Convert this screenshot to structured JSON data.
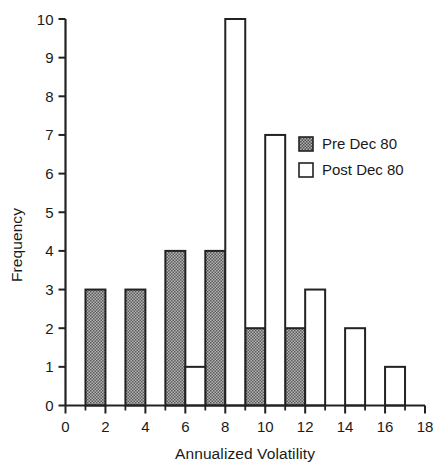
{
  "chart_data": {
    "type": "bar",
    "title": "",
    "subtitle": "",
    "xlabel": "Annualized Volatility",
    "ylabel": "Frequency",
    "xlim": [
      0,
      18
    ],
    "ylim": [
      0,
      10
    ],
    "x_major_ticks": [
      0,
      2,
      4,
      6,
      8,
      10,
      12,
      14,
      16,
      18
    ],
    "x_major_tick_labels": [
      "0",
      "2",
      "4",
      "6",
      "8",
      "10",
      "12",
      "14",
      "16",
      "18"
    ],
    "x_minor_ticks": [
      1,
      3,
      5,
      7,
      9,
      11,
      13,
      15,
      17
    ],
    "y_ticks": [
      0,
      1,
      2,
      3,
      4,
      5,
      6,
      7,
      8,
      9,
      10
    ],
    "y_tick_labels": [
      "0",
      "1",
      "2",
      "3",
      "4",
      "5",
      "6",
      "7",
      "8",
      "9",
      "10"
    ],
    "grid": false,
    "legend_position": "upper right",
    "bin_width": 1,
    "series": [
      {
        "name": "Pre Dec 80",
        "fill": "hatched-gray",
        "color": "#8c8c8c",
        "edge_color": "#222222",
        "bins": [
          {
            "x0": 1,
            "x1": 2,
            "value": 3
          },
          {
            "x0": 3,
            "x1": 4,
            "value": 3
          },
          {
            "x0": 5,
            "x1": 6,
            "value": 4
          },
          {
            "x0": 7,
            "x1": 8,
            "value": 4
          },
          {
            "x0": 9,
            "x1": 10,
            "value": 2
          },
          {
            "x0": 11,
            "x1": 12,
            "value": 2
          }
        ]
      },
      {
        "name": "Post Dec 80",
        "fill": "white",
        "color": "#ffffff",
        "edge_color": "#222222",
        "bins": [
          {
            "x0": 6,
            "x1": 7,
            "value": 1
          },
          {
            "x0": 8,
            "x1": 9,
            "value": 10
          },
          {
            "x0": 10,
            "x1": 11,
            "value": 7
          },
          {
            "x0": 12,
            "x1": 13,
            "value": 3
          },
          {
            "x0": 14,
            "x1": 15,
            "value": 2
          },
          {
            "x0": 16,
            "x1": 17,
            "value": 1
          }
        ]
      }
    ]
  },
  "legend": {
    "entries": [
      {
        "label": "Pre Dec 80",
        "swatch": "hatched-gray-swatch"
      },
      {
        "label": "Post Dec 80",
        "swatch": "white-swatch"
      }
    ]
  },
  "axes": {
    "x_title": "Annualized Volatility",
    "y_title": "Frequency"
  },
  "colors": {
    "axis": "#222222",
    "pre_fill": "#8c8c8c",
    "post_fill": "#ffffff",
    "background": "#ffffff"
  }
}
